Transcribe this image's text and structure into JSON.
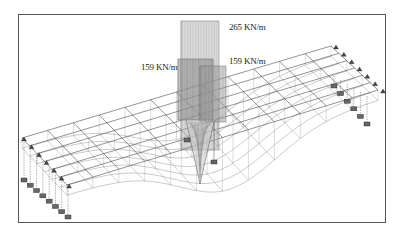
{
  "figure": {
    "type": "3D grillage model with line loads",
    "labels": {
      "load_top": "265 KN/m",
      "load_left": "159 KN/m",
      "load_right": "159 KN/m"
    },
    "colors": {
      "frame": "#555555",
      "mesh": "#3a3a3a",
      "mesh_light": "#8a8a8a",
      "load_fill": "#bdbdbd",
      "load_dense": "#555555",
      "support": "#444444",
      "spring_block": "#666666"
    },
    "mesh": {
      "longitudinal_divisions": 12,
      "transverse_divisions": 6
    },
    "supports": {
      "left_edge_count": 7,
      "right_edge_count": 7,
      "left_spring_count": 8,
      "right_spring_count": 6,
      "midspan_spring_count": 2
    }
  }
}
